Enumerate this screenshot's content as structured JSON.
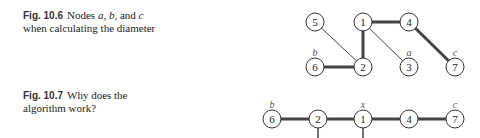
{
  "figures": [
    {
      "number": "Fig. 10.6",
      "caption_pre": "Nodes ",
      "var_a": "a",
      "sep1": ", ",
      "var_b": "b",
      "sep2": ", and ",
      "var_c": "c",
      "caption_post": " when calculating the diameter",
      "nodes": [
        {
          "id": "5",
          "x": 315,
          "y": 22
        },
        {
          "id": "1",
          "x": 363,
          "y": 22
        },
        {
          "id": "4",
          "x": 409,
          "y": 22
        },
        {
          "id": "6",
          "x": 315,
          "y": 67,
          "label": "b"
        },
        {
          "id": "2",
          "x": 363,
          "y": 67
        },
        {
          "id": "3",
          "x": 409,
          "y": 67,
          "label": "a"
        },
        {
          "id": "7",
          "x": 455,
          "y": 67,
          "label": "c"
        }
      ],
      "edges": [
        {
          "from": "5",
          "to": "2",
          "bold": false
        },
        {
          "from": "1",
          "to": "2",
          "bold": true
        },
        {
          "from": "1",
          "to": "4",
          "bold": true
        },
        {
          "from": "1",
          "to": "3",
          "bold": false
        },
        {
          "from": "4",
          "to": "7",
          "bold": true
        },
        {
          "from": "6",
          "to": "2",
          "bold": true
        }
      ]
    },
    {
      "number": "Fig. 10.7",
      "caption": "Why does the algorithm work?",
      "nodes": [
        {
          "id": "6",
          "x": 272,
          "y": 119,
          "label": "b"
        },
        {
          "id": "2",
          "x": 318,
          "y": 119
        },
        {
          "id": "1",
          "x": 363,
          "y": 119,
          "label": "x"
        },
        {
          "id": "4",
          "x": 409,
          "y": 119
        },
        {
          "id": "7",
          "x": 455,
          "y": 119,
          "label": "c"
        }
      ]
    }
  ]
}
